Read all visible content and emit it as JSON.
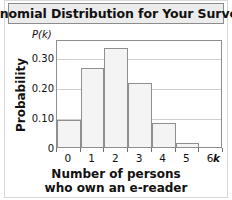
{
  "figure": {
    "title": "Binomial Distribution for Your Survey",
    "axis_variable_symbol": "k",
    "unit_label_p": "P",
    "unit_label_k": "(k)"
  },
  "chart_data": {
    "type": "bar",
    "title": "Binomial Distribution for Your Survey",
    "categories": [
      "0",
      "1",
      "2",
      "3",
      "4",
      "5",
      "6"
    ],
    "values": [
      0.09,
      0.265,
      0.33,
      0.215,
      0.08,
      0.015,
      0.0
    ],
    "xlabel_line1": "Number of persons",
    "xlabel_line2": "who own an e-reader",
    "ylabel": "Probability",
    "y_unit_label": "P(k)",
    "x_variable_label": "k",
    "xlim": [
      0,
      7
    ],
    "ylim": [
      0,
      0.36
    ],
    "yticks": [
      "0",
      "0.10",
      "0.20",
      "0.30"
    ],
    "ytick_values": [
      0,
      0.1,
      0.2,
      0.3
    ],
    "xticks": [
      "0",
      "1",
      "2",
      "3",
      "4",
      "5",
      "6"
    ],
    "grid": true,
    "legend": false,
    "bar_fill_color": "#f4f4f4",
    "bar_edge_color": "#8f8f8f",
    "grid_color": "#cfcfcf",
    "frame_color": "#8f8f8f",
    "title_bar_color": "#ececec"
  }
}
